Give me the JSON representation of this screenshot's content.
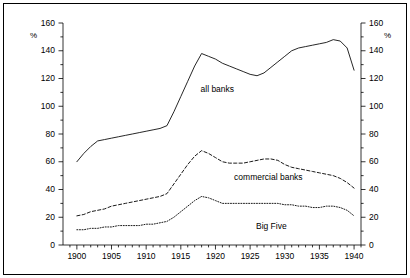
{
  "figure": {
    "background_color": "#ffffff",
    "frame_color": "#000000",
    "line_color": "#000000"
  },
  "axes": {
    "left_unit_label": "%",
    "right_unit_label": "%",
    "y_ticks": [
      0,
      20,
      40,
      60,
      80,
      100,
      120,
      140,
      160
    ],
    "y_tick_labels": [
      "0",
      "20",
      "40",
      "60",
      "80",
      "100",
      "120",
      "140",
      "160"
    ],
    "y_minor_step": 10,
    "ylim": [
      0,
      160
    ],
    "x_ticks": [
      1900,
      1905,
      1910,
      1915,
      1920,
      1925,
      1930,
      1935,
      1940
    ],
    "x_tick_labels": [
      "1900",
      "1905",
      "1910",
      "1915",
      "1920",
      "1925",
      "1930",
      "1935",
      "1940"
    ],
    "x_minor_step": 1,
    "xlim": [
      1898,
      1941
    ]
  },
  "series_labels": {
    "all_banks": "all banks",
    "commercial_banks": "commercial banks",
    "big_five": "Big Five"
  },
  "chart_data": {
    "type": "line",
    "title": "",
    "xlabel": "",
    "ylabel": "%",
    "xlim": [
      1898,
      1941
    ],
    "ylim": [
      0,
      160
    ],
    "grid": false,
    "legend": "inline-annotations",
    "x": [
      1900,
      1901,
      1902,
      1903,
      1904,
      1905,
      1906,
      1907,
      1908,
      1909,
      1910,
      1911,
      1912,
      1913,
      1914,
      1915,
      1916,
      1917,
      1918,
      1919,
      1920,
      1921,
      1922,
      1923,
      1924,
      1925,
      1926,
      1927,
      1928,
      1929,
      1930,
      1931,
      1932,
      1933,
      1934,
      1935,
      1936,
      1937,
      1938,
      1939,
      1940
    ],
    "series": [
      {
        "name": "all banks",
        "style": "solid",
        "values": [
          60,
          66,
          71,
          75,
          76,
          77,
          78,
          79,
          80,
          81,
          82,
          83,
          84,
          86,
          96,
          107,
          118,
          129,
          138,
          136,
          134,
          131,
          129,
          127,
          125,
          123,
          122,
          124,
          128,
          132,
          136,
          140,
          142,
          143,
          144,
          145,
          146,
          148,
          147,
          142,
          126
        ]
      },
      {
        "name": "commercial banks",
        "style": "dashed",
        "values": [
          21,
          22,
          24,
          25,
          26,
          28,
          29,
          30,
          31,
          32,
          33,
          34,
          35,
          37,
          44,
          51,
          58,
          64,
          68,
          66,
          63,
          60,
          59,
          59,
          59,
          60,
          61,
          62,
          62,
          61,
          58,
          56,
          55,
          54,
          53,
          52,
          51,
          50,
          48,
          45,
          41
        ]
      },
      {
        "name": "Big Five",
        "style": "dotted",
        "values": [
          11,
          11,
          12,
          12,
          13,
          13,
          14,
          14,
          14,
          14,
          15,
          15,
          16,
          17,
          20,
          24,
          28,
          32,
          35,
          34,
          32,
          30,
          30,
          30,
          30,
          30,
          30,
          30,
          30,
          30,
          29,
          29,
          28,
          28,
          27,
          27,
          28,
          28,
          27,
          25,
          21
        ]
      }
    ]
  }
}
